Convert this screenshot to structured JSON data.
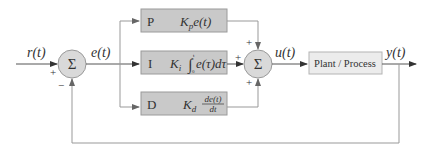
{
  "colors": {
    "background": "#ffffff",
    "line": "#8c8c8c",
    "arrow": "#333333",
    "pid_box_fill": "#c9c9c9",
    "pid_box_stroke": "#9a9a9a",
    "plant_box_fill": "#ececec",
    "plant_box_stroke": "#b4b4b4",
    "sum_fill": "#d9d9d9",
    "sum_stroke": "#9a9a9a",
    "text": "#333333"
  },
  "signals": {
    "reference": "r(t)",
    "error": "e(t)",
    "control": "u(t)",
    "output": "y(t)"
  },
  "summing_junctions": [
    {
      "id": "error-sum",
      "symbol": "Σ",
      "signs": {
        "left": "+",
        "bottom": "−"
      }
    },
    {
      "id": "controller-sum",
      "symbol": "Σ",
      "signs": {
        "top": "+",
        "left": "+",
        "bottom": "+"
      }
    }
  ],
  "blocks": {
    "p": {
      "letter": "P",
      "gain": "K",
      "gain_sub": "p",
      "expr": "e(t)"
    },
    "i": {
      "letter": "I",
      "gain": "K",
      "gain_sub": "i",
      "integral": "∫",
      "lower_limit": "0",
      "upper_limit": "t",
      "expr": "e(τ)dτ"
    },
    "d": {
      "letter": "D",
      "gain": "K",
      "gain_sub": "d",
      "numerator": "de(t)",
      "denominator": "dt"
    },
    "plant": {
      "label": "Plant / Process"
    }
  }
}
